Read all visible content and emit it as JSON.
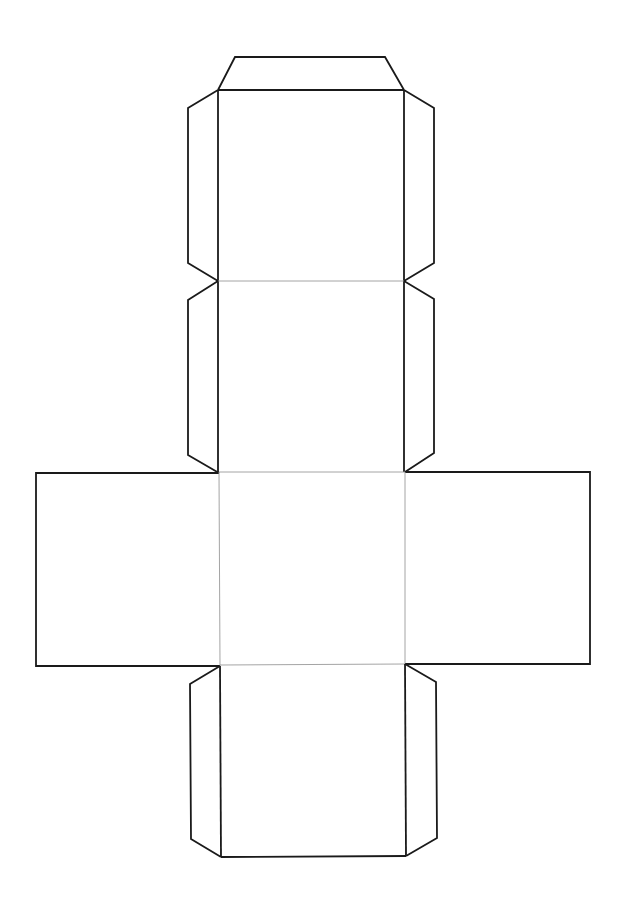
{
  "diagram": {
    "type": "cube-net",
    "colors": {
      "background": "#ffffff",
      "cut_line": "#1a1a1a",
      "fold_line": "#9a9a9a"
    },
    "faces": [
      {
        "id": "top",
        "x1": 218,
        "y1": 90,
        "x2": 404,
        "y2": 281
      },
      {
        "id": "upper-middle",
        "x1": 218,
        "y1": 281,
        "x2": 404,
        "y2": 472
      },
      {
        "id": "center",
        "x1": 219,
        "y1": 472,
        "x2": 405,
        "y2": 665
      },
      {
        "id": "left",
        "x1": 36,
        "y1": 473,
        "x2": 219,
        "y2": 666
      },
      {
        "id": "right",
        "x1": 405,
        "y1": 472,
        "x2": 590,
        "y2": 664
      },
      {
        "id": "bottom",
        "x1": 220,
        "y1": 665,
        "x2": 406,
        "y2": 857
      }
    ]
  }
}
